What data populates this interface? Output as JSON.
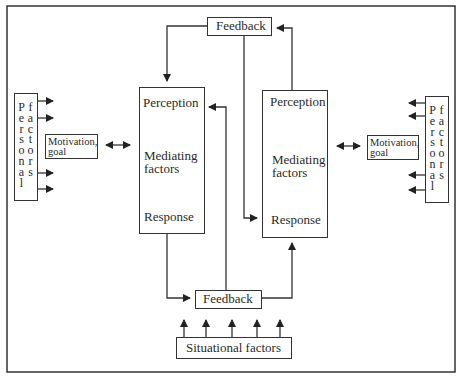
{
  "diagram": {
    "feedback_top": "Feedback",
    "feedback_bottom": "Feedback",
    "situational_factors": "Situational factors",
    "left_process": {
      "perception": "Perception",
      "mediating_line1": "Mediating",
      "mediating_line2": "factors",
      "response": "Response"
    },
    "right_process": {
      "perception": "Perception",
      "mediating_line1": "Mediating",
      "mediating_line2": "factors",
      "response": "Response"
    },
    "left_motivation": {
      "line1": "Motivation,",
      "line2": "goal"
    },
    "right_motivation": {
      "line1": "Motivation,",
      "line2": "goal"
    },
    "left_personal_factors": {
      "col1": "Personal",
      "col2": "factors"
    },
    "right_personal_factors": {
      "col1": "Personal",
      "col2": "factors"
    },
    "colors": {
      "stroke": "#333333",
      "background": "#ffffff"
    }
  }
}
